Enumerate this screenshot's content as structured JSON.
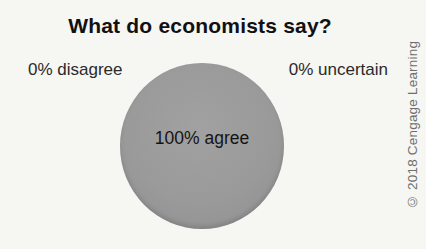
{
  "figure": {
    "title": "What do economists say?",
    "credit": "© 2018 Cengage Learning"
  },
  "pie": {
    "label_left": "0% disagree",
    "label_right": "0% uncertain",
    "label_center": "100% agree"
  },
  "colors": {
    "background": "#f6f6f3",
    "pie_fill": "#9a9a9a",
    "title_text": "#111111",
    "label_text": "#2a2a2a",
    "credit_text": "#6e6e6e"
  },
  "chart_data": {
    "type": "pie",
    "title": "What do economists say?",
    "categories": [
      "agree",
      "disagree",
      "uncertain"
    ],
    "values": [
      100,
      0,
      0
    ],
    "slice_labels": [
      "100% agree",
      "0% disagree",
      "0% uncertain"
    ],
    "slice_colors": [
      "#9a9a9a",
      null,
      null
    ],
    "legend_position": "none"
  }
}
